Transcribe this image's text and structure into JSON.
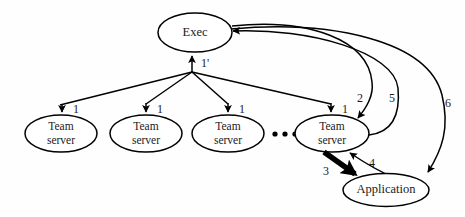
{
  "diagram": {
    "background_color": "#fefefe",
    "stroke_color": "#000000",
    "text_color": "#1a1a1a",
    "nodes": {
      "exec": {
        "label": "Exec",
        "shape": "ellipse"
      },
      "team_server_1": {
        "line1": "Team",
        "line2": "server",
        "shape": "ellipse"
      },
      "team_server_2": {
        "line1": "Team",
        "line2": "server",
        "shape": "ellipse"
      },
      "team_server_3": {
        "line1": "Team",
        "line2": "server",
        "shape": "ellipse"
      },
      "team_server_4": {
        "line1": "Team",
        "line2": "server",
        "shape": "ellipse"
      },
      "application": {
        "label": "Application",
        "shape": "ellipse"
      }
    },
    "ellipsis": {
      "symbol": "•••",
      "dot_count": 3
    },
    "edge_labels": {
      "e1_prime": "1'",
      "e1_a": "1",
      "e1_b": "1",
      "e1_c": "1",
      "e1_d": "1",
      "e2": "2",
      "e3": "3",
      "e4": "4",
      "e5": "5",
      "e6": "6"
    },
    "edges": [
      {
        "id": "1'",
        "from": "team-servers-fanin",
        "to": "exec",
        "label": "1'",
        "style": "thin"
      },
      {
        "id": "1a",
        "from": "exec-fanout",
        "to": "team_server_1",
        "label": "1",
        "style": "thin"
      },
      {
        "id": "1b",
        "from": "exec-fanout",
        "to": "team_server_2",
        "label": "1",
        "style": "thin"
      },
      {
        "id": "1c",
        "from": "exec-fanout",
        "to": "team_server_3",
        "label": "1",
        "style": "thin"
      },
      {
        "id": "1d",
        "from": "exec-fanout",
        "to": "team_server_4",
        "label": "1",
        "style": "thin"
      },
      {
        "id": "2",
        "from": "exec",
        "to": "team_server_4",
        "label": "2",
        "style": "curve"
      },
      {
        "id": "3",
        "from": "team_server_4",
        "to": "application",
        "label": "3",
        "style": "thick"
      },
      {
        "id": "4",
        "from": "application",
        "to": "team_server_4",
        "label": "4",
        "style": "thin"
      },
      {
        "id": "5",
        "from": "team_server_4",
        "to": "exec",
        "label": "5",
        "style": "curve"
      },
      {
        "id": "6",
        "from": "exec",
        "to": "application",
        "label": "6",
        "style": "curve"
      }
    ]
  }
}
